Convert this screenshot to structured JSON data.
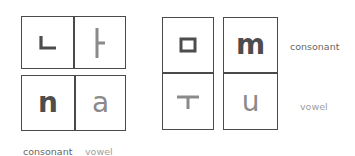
{
  "diagram": {
    "left_group": {
      "top_row": {
        "consonant": "ㄴ",
        "vowel": "ㅏ"
      },
      "bottom_row": {
        "consonant": "n",
        "vowel": "a"
      },
      "legend": {
        "consonant_label": "consonant",
        "vowel_label": "vowel"
      }
    },
    "right_group": {
      "left_column": {
        "consonant": "ㅁ",
        "vowel": "ㅜ"
      },
      "right_column": {
        "consonant": "m",
        "vowel": "u"
      },
      "legend": {
        "consonant_label": "consonant",
        "vowel_label": "vowel"
      }
    },
    "colors": {
      "consonant": "#4d4d4d",
      "vowel": "#8a8a8a",
      "border": "#4a4a4a"
    }
  }
}
